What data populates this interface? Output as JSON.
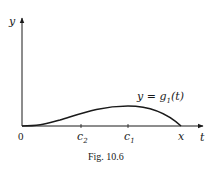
{
  "figure": {
    "caption": "Fig. 10.6",
    "y_axis_label": "y",
    "x_axis_label": "t",
    "origin_label": "0",
    "curve_label": {
      "lhs": "y = g",
      "sub": "1",
      "rhs": "(t)"
    },
    "ticks": [
      {
        "id": "c2",
        "base": "c",
        "sub": "2"
      },
      {
        "id": "c1",
        "base": "c",
        "sub": "1"
      },
      {
        "id": "x",
        "base": "x",
        "sub": ""
      }
    ],
    "curve_description": "starts at 0 tangent to t-axis, rises to a maximum at c1, falls to zero at x; inflection at c2",
    "colors": {
      "ink": "#1a1a1a",
      "background": "#ffffff"
    }
  }
}
